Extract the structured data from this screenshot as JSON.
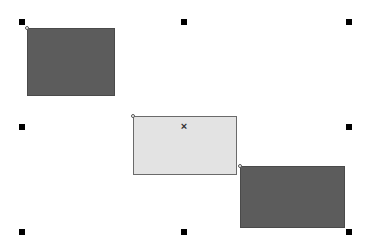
{
  "canvas": {
    "background": "#ffffff",
    "shapes": [
      {
        "id": "shape-1",
        "fill": "#5c5c5c",
        "x": 27,
        "y": 28,
        "w": 88,
        "h": 68
      },
      {
        "id": "shape-2",
        "fill": "#e3e3e3",
        "x": 133,
        "y": 116,
        "w": 104,
        "h": 59,
        "selected_center_mark": "×"
      },
      {
        "id": "shape-3",
        "fill": "#5c5c5c",
        "x": 240,
        "y": 166,
        "w": 105,
        "h": 62
      }
    ],
    "selection_handles": [
      {
        "x": 22,
        "y": 22
      },
      {
        "x": 184,
        "y": 22
      },
      {
        "x": 349,
        "y": 22
      },
      {
        "x": 22,
        "y": 127
      },
      {
        "x": 349,
        "y": 127
      },
      {
        "x": 22,
        "y": 232
      },
      {
        "x": 184,
        "y": 232
      },
      {
        "x": 349,
        "y": 232
      }
    ],
    "center_mark": "×"
  }
}
